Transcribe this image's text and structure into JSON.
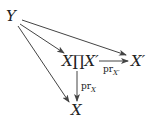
{
  "diagram": {
    "type": "commutative-diagram",
    "nodes": {
      "Y": "Y",
      "product": "X∏X′",
      "Xprime": "X′",
      "X": "X"
    },
    "edges": [
      {
        "from": "Y",
        "to": "product",
        "label": ""
      },
      {
        "from": "Y",
        "to": "Xprime",
        "label": ""
      },
      {
        "from": "Y",
        "to": "X",
        "label": ""
      },
      {
        "from": "product",
        "to": "Xprime",
        "label": "pr",
        "label_sub": "X′"
      },
      {
        "from": "product",
        "to": "X",
        "label": "pr",
        "label_sub": "X"
      }
    ],
    "colors": {
      "stroke": "#444444",
      "text": "#222222"
    }
  }
}
